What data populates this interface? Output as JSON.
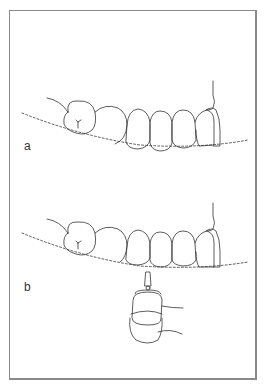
{
  "figure": {
    "panels": [
      {
        "label": "a",
        "description": "maxillary dentition with dashed occlusal curve"
      },
      {
        "label": "b",
        "description": "maxillary dentition with dashed occlusal curve and mallet instrument below"
      }
    ]
  },
  "colors": {
    "line": "#333333",
    "frame": "#8a8a8a",
    "background": "#ffffff"
  }
}
